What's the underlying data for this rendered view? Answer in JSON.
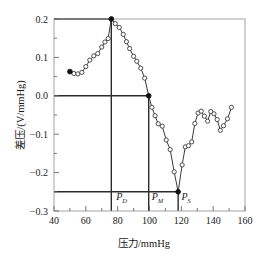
{
  "chart_data": {
    "type": "line",
    "title": "",
    "xlabel": "压力/mmHg",
    "ylabel": "差压/(V/mmHg)",
    "xlim": [
      40,
      160
    ],
    "ylim": [
      -0.3,
      0.2
    ],
    "xticks": [
      40,
      60,
      80,
      100,
      120,
      140,
      160
    ],
    "xtick_labels": [
      "40",
      "60",
      "80",
      "100",
      "120",
      "140",
      "160"
    ],
    "xminor_step": 10,
    "yticks": [
      -0.3,
      -0.2,
      -0.1,
      0.0,
      0.1,
      0.2
    ],
    "ytick_labels": [
      "−0.3",
      "−0.2",
      "−0.1",
      "0.0",
      "0.1",
      "0.2"
    ],
    "yminor_step": 0.05,
    "grid": false,
    "legend": null,
    "marker": "open-circle",
    "line_color": "#3a3a3a",
    "series": [
      {
        "name": "差压",
        "x": [
          50.0,
          52.5,
          55.0,
          57.5,
          60.0,
          62.5,
          65.0,
          67.5,
          70.0,
          72.0,
          74.0,
          76.0,
          78.5,
          81.0,
          83.5,
          85.5,
          87.5,
          90.0,
          92.0,
          94.5,
          97.0,
          99.5,
          101.5,
          103.5,
          105.5,
          108.0,
          110.5,
          113.0,
          115.5,
          118.0,
          120.5,
          122.5,
          124.5,
          126.5,
          128.5,
          130.5,
          132.5,
          134.5,
          136.5,
          138.5,
          140.5,
          142.5,
          144.5,
          146.5,
          149.0,
          151.5
        ],
        "y": [
          0.063,
          0.058,
          0.057,
          0.061,
          0.076,
          0.093,
          0.104,
          0.11,
          0.127,
          0.14,
          0.149,
          0.2,
          0.188,
          0.178,
          0.16,
          0.141,
          0.123,
          0.103,
          0.09,
          0.072,
          0.046,
          0.0,
          -0.03,
          -0.052,
          -0.073,
          -0.079,
          -0.115,
          -0.14,
          -0.198,
          -0.25,
          -0.18,
          -0.133,
          -0.13,
          -0.12,
          -0.072,
          -0.045,
          -0.04,
          -0.053,
          -0.066,
          -0.041,
          -0.047,
          -0.062,
          -0.09,
          -0.078,
          -0.06,
          -0.03
        ]
      }
    ],
    "highlight_points": [
      {
        "name": "start-point",
        "x": 50.0,
        "y": 0.063,
        "style": "filled"
      },
      {
        "name": "diastolic-peak",
        "x": 76.0,
        "y": 0.2,
        "style": "filled"
      },
      {
        "name": "mean-crossing",
        "x": 99.5,
        "y": 0.0,
        "style": "filled"
      },
      {
        "name": "systolic-min",
        "x": 118.0,
        "y": -0.25,
        "style": "filled"
      }
    ],
    "guide_lines": [
      {
        "name": "peak-horizontal",
        "orientation": "horizontal",
        "value": 0.2,
        "from": 40,
        "to": 76
      },
      {
        "name": "peak-vertical",
        "orientation": "vertical",
        "value": 76.0,
        "from": -0.3,
        "to": 0.2
      },
      {
        "name": "zero-horizontal",
        "orientation": "horizontal",
        "value": 0.0,
        "from": 40,
        "to": 99.5
      },
      {
        "name": "mean-vertical",
        "orientation": "vertical",
        "value": 99.5,
        "from": -0.3,
        "to": 0.0
      },
      {
        "name": "min-horizontal",
        "orientation": "horizontal",
        "value": -0.25,
        "from": 40,
        "to": 118
      },
      {
        "name": "min-vertical",
        "orientation": "vertical",
        "value": 118.0,
        "from": -0.3,
        "to": -0.25
      }
    ],
    "annotations": [
      {
        "name": "pd-label",
        "base": "P",
        "sub": "D",
        "x": 82.5,
        "y": -0.272
      },
      {
        "name": "pm-label",
        "base": "P",
        "sub": "M",
        "x": 105.0,
        "y": -0.272
      },
      {
        "name": "ps-label",
        "base": "P",
        "sub": "S",
        "x": 123.0,
        "y": -0.272
      }
    ]
  }
}
